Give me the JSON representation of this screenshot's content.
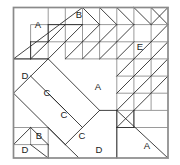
{
  "figure": {
    "canvas": {
      "width": 180,
      "height": 165,
      "background": "#ffffff"
    },
    "square": {
      "x": 13.5,
      "y": 7.5,
      "size": 154.5,
      "grid_divisions": 9,
      "cell": 17.1667,
      "border_color": "#8a8a8a",
      "border_width": 1.6,
      "line_color": "#3d3d3d",
      "line_width": 0.85,
      "grid_color": "#8f8f8f",
      "grid_width": 1.0
    },
    "labels": [
      {
        "id": "label-a-top-left",
        "text": "A",
        "x": 38,
        "y": 25
      },
      {
        "id": "label-b-top",
        "text": "B",
        "x": 79,
        "y": 15
      },
      {
        "id": "label-e-top-right",
        "text": "E",
        "x": 140,
        "y": 47
      },
      {
        "id": "label-d-mid-left",
        "text": "D",
        "x": 25,
        "y": 76
      },
      {
        "id": "label-c-upper",
        "text": "C",
        "x": 47,
        "y": 93
      },
      {
        "id": "label-a-center",
        "text": "A",
        "x": 98,
        "y": 87
      },
      {
        "id": "label-c-middle",
        "text": "C",
        "x": 64,
        "y": 115
      },
      {
        "id": "label-c-lower",
        "text": "C",
        "x": 82,
        "y": 136
      },
      {
        "id": "label-b-bottom-left",
        "text": "B",
        "x": 39,
        "y": 136
      },
      {
        "id": "label-d-bottom-left",
        "text": "D",
        "x": 25,
        "y": 150
      },
      {
        "id": "label-d-bottom-mid",
        "text": "D",
        "x": 99,
        "y": 150
      },
      {
        "id": "label-a-bottom-right",
        "text": "A",
        "x": 147,
        "y": 146
      }
    ]
  },
  "chart_data": {
    "type": "diagram",
    "grid": {
      "columns": 9,
      "rows": 9,
      "cell_size": 17.1667
    },
    "pieces": [
      {
        "label": "A",
        "count": 3
      },
      {
        "label": "B",
        "count": 2
      },
      {
        "label": "C",
        "count": 3
      },
      {
        "label": "D",
        "count": 3
      },
      {
        "label": "E",
        "count": 1
      }
    ]
  }
}
